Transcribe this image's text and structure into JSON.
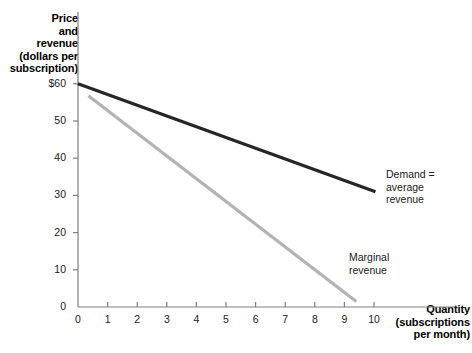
{
  "chart_data": {
    "type": "line",
    "title": "",
    "ylabel": "Price and revenue (dollars per subscription)",
    "xlabel": "Quantity (subscriptions per month)",
    "ylabel_lines": [
      "Price",
      "and",
      "revenue",
      "(dollars per",
      "subscription)"
    ],
    "xlabel_lines": [
      "Quantity",
      "(subscriptions",
      "per month)"
    ],
    "xlim": [
      0,
      10.6
    ],
    "ylim": [
      0,
      62
    ],
    "grid": false,
    "legend_position": "inline-annotations",
    "yticks": [
      {
        "value": 60,
        "label": "$60"
      },
      {
        "value": 50,
        "label": "50"
      },
      {
        "value": 40,
        "label": "40"
      },
      {
        "value": 30,
        "label": "30"
      },
      {
        "value": 20,
        "label": "20"
      },
      {
        "value": 10,
        "label": "10"
      },
      {
        "value": 0,
        "label": "0"
      }
    ],
    "xticks": [
      {
        "value": 0,
        "label": "0"
      },
      {
        "value": 1,
        "label": "1"
      },
      {
        "value": 2,
        "label": "2"
      },
      {
        "value": 3,
        "label": "3"
      },
      {
        "value": 4,
        "label": "4"
      },
      {
        "value": 5,
        "label": "5"
      },
      {
        "value": 6,
        "label": "6"
      },
      {
        "value": 7,
        "label": "7"
      },
      {
        "value": 8,
        "label": "8"
      },
      {
        "value": 9,
        "label": "9"
      },
      {
        "value": 10,
        "label": "10"
      }
    ],
    "series": [
      {
        "name": "Demand = average revenue",
        "color": "#262626",
        "width": 3.2,
        "x": [
          0,
          10.05
        ],
        "y": [
          60,
          31
        ]
      },
      {
        "name": "Marginal revenue",
        "color": "#b3b3b3",
        "width": 3.2,
        "x": [
          0.35,
          9.4
        ],
        "y": [
          56.8,
          1.5
        ]
      }
    ],
    "annotations": [
      {
        "name": "demand-label",
        "lines": [
          "Demand =",
          "average",
          "revenue"
        ],
        "x": 10.4,
        "y": 33
      },
      {
        "name": "marginal-revenue-label",
        "lines": [
          "Marginal",
          "revenue"
        ],
        "x": 9.2,
        "y": 13
      }
    ],
    "axis_color": "#808080"
  }
}
